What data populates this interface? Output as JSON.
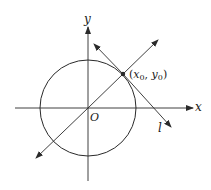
{
  "diagram": {
    "type": "geometry",
    "stroke_color": "#2a2a2a",
    "labels": {
      "x_axis": "x",
      "y_axis": "y",
      "origin": "O",
      "tangent_line": "l",
      "point_x": "x",
      "point_x_sub": "0",
      "point_sep": ", ",
      "point_y": "y",
      "point_y_sub": "0",
      "point_open": "(",
      "point_close": ")"
    },
    "geometry": {
      "origin": [
        88,
        108
      ],
      "circle_radius": 48,
      "tangent_point": [
        123,
        74
      ],
      "radial_line": {
        "from": [
          36,
          158
        ],
        "to": [
          158,
          40
        ]
      },
      "tangent_line": {
        "from": [
          94,
          44
        ],
        "to": [
          171,
          127
        ]
      },
      "x_axis": {
        "from": [
          15,
          108
        ],
        "to": [
          193,
          108
        ]
      },
      "y_axis": {
        "from": [
          88,
          181
        ],
        "to": [
          88,
          27
        ]
      }
    }
  }
}
